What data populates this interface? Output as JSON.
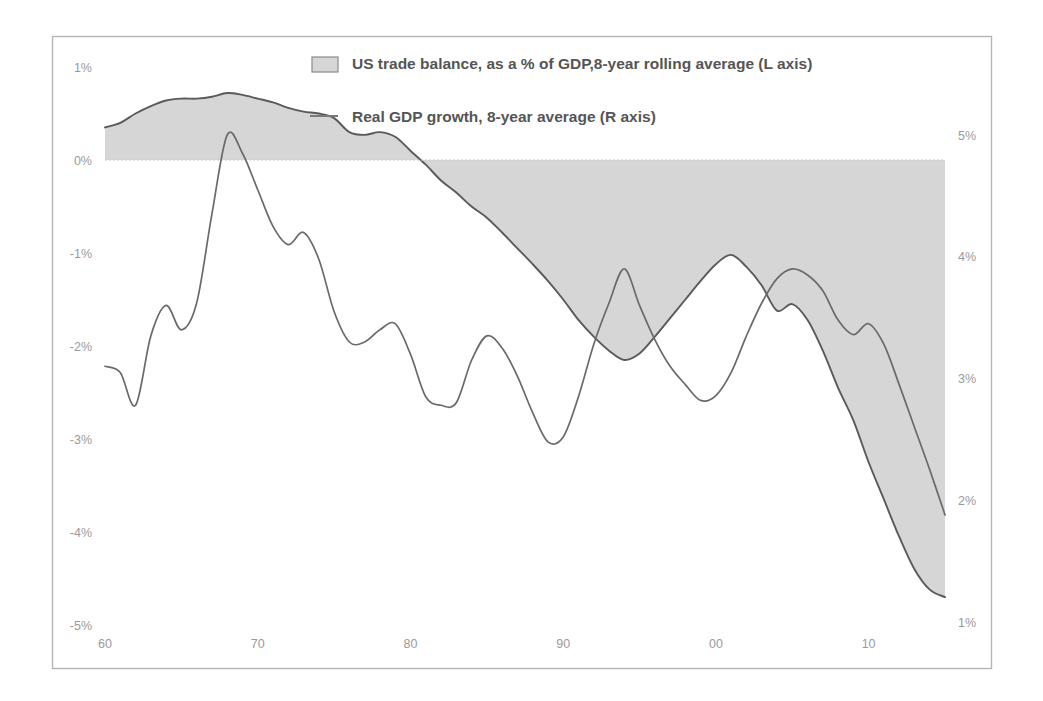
{
  "chart_data": {
    "type": "area",
    "title": "",
    "subtitle": "",
    "xlabel": "",
    "ylabel": "",
    "y2label": "",
    "grid": false,
    "legend_position": "top-center",
    "xlim": [
      1960,
      2015
    ],
    "ylim": [
      -5,
      1
    ],
    "y2lim": [
      1,
      5
    ],
    "x_ticks": [
      "60",
      "70",
      "80",
      "90",
      "00",
      "10"
    ],
    "x_tick_values": [
      1960,
      1970,
      1980,
      1990,
      2000,
      2010
    ],
    "y_ticks": [
      "1%",
      "0%",
      "-1%",
      "-2%",
      "-3%",
      "-4%",
      "-5%"
    ],
    "y_tick_values": [
      1,
      0,
      -1,
      -2,
      -3,
      -4,
      -5
    ],
    "y2_ticks": [
      "5%",
      "4%",
      "3%",
      "2%",
      "1%"
    ],
    "y2_tick_values": [
      5,
      4,
      3,
      2,
      1
    ],
    "series": [
      {
        "name": "US trade balance, as a % of GDP,8-year rolling average (L axis)",
        "type": "area",
        "axis": "left",
        "fill": "#d4d4d4",
        "stroke": "#595959",
        "x": [
          1960,
          1961,
          1962,
          1963,
          1964,
          1965,
          1966,
          1967,
          1968,
          1969,
          1970,
          1971,
          1972,
          1973,
          1974,
          1975,
          1976,
          1977,
          1978,
          1979,
          1980,
          1981,
          1982,
          1983,
          1984,
          1985,
          1986,
          1987,
          1988,
          1989,
          1990,
          1991,
          1992,
          1993,
          1994,
          1995,
          1996,
          1997,
          1998,
          1999,
          2000,
          2001,
          2002,
          2003,
          2004,
          2005,
          2006,
          2007,
          2008,
          2009,
          2010,
          2011,
          2012,
          2013,
          2014,
          2015
        ],
        "values": [
          0.35,
          0.4,
          0.5,
          0.58,
          0.64,
          0.66,
          0.66,
          0.68,
          0.72,
          0.7,
          0.66,
          0.62,
          0.56,
          0.52,
          0.5,
          0.45,
          0.3,
          0.27,
          0.3,
          0.25,
          0.1,
          -0.05,
          -0.22,
          -0.35,
          -0.5,
          -0.62,
          -0.78,
          -0.95,
          -1.12,
          -1.3,
          -1.5,
          -1.72,
          -1.9,
          -2.05,
          -2.15,
          -2.08,
          -1.9,
          -1.7,
          -1.5,
          -1.3,
          -1.12,
          -1.02,
          -1.15,
          -1.35,
          -1.62,
          -1.55,
          -1.72,
          -2.05,
          -2.45,
          -2.8,
          -3.25,
          -3.65,
          -4.05,
          -4.4,
          -4.62,
          -4.7
        ]
      },
      {
        "name": "Real GDP growth, 8-year average (R axis)",
        "type": "line",
        "axis": "right",
        "stroke": "#595959",
        "x": [
          1960,
          1961,
          1962,
          1963,
          1964,
          1965,
          1966,
          1967,
          1968,
          1969,
          1970,
          1971,
          1972,
          1973,
          1974,
          1975,
          1976,
          1977,
          1978,
          1979,
          1980,
          1981,
          1982,
          1983,
          1984,
          1985,
          1986,
          1987,
          1988,
          1989,
          1990,
          1991,
          1992,
          1993,
          1994,
          1995,
          1996,
          1997,
          1998,
          1999,
          2000,
          2001,
          2002,
          2003,
          2004,
          2005,
          2006,
          2007,
          2008,
          2009,
          2010,
          2011,
          2012,
          2013,
          2014,
          2015
        ],
        "values": [
          3.1,
          3.05,
          2.78,
          3.35,
          3.6,
          3.4,
          3.62,
          4.35,
          5.0,
          4.85,
          4.55,
          4.25,
          4.1,
          4.2,
          3.98,
          3.55,
          3.3,
          3.3,
          3.4,
          3.45,
          3.2,
          2.85,
          2.78,
          2.8,
          3.15,
          3.35,
          3.25,
          3.02,
          2.72,
          2.48,
          2.52,
          2.85,
          3.28,
          3.62,
          3.9,
          3.6,
          3.32,
          3.1,
          2.95,
          2.82,
          2.86,
          3.05,
          3.35,
          3.62,
          3.82,
          3.9,
          3.85,
          3.72,
          3.48,
          3.36,
          3.45,
          3.28,
          2.95,
          2.6,
          2.25,
          1.88
        ]
      }
    ]
  },
  "legend": {
    "items": [
      {
        "marker": "area-swatch",
        "label": "US trade balance, as a % of GDP,8-year rolling average (L axis)"
      },
      {
        "marker": "line-swatch",
        "label": "Real GDP growth, 8-year average (R axis)"
      }
    ]
  }
}
